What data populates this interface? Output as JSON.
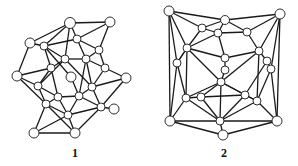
{
  "figure": {
    "structures": [
      {
        "label": "1",
        "label_pos": [
          75,
          146
        ],
        "nodes": [
          [
            70,
            23,
            5.5
          ],
          [
            110,
            22,
            5
          ],
          [
            30,
            43,
            5
          ],
          [
            44,
            46,
            4
          ],
          [
            77,
            39,
            4
          ],
          [
            99,
            50,
            4
          ],
          [
            65,
            59,
            4
          ],
          [
            86,
            59,
            4
          ],
          [
            51,
            68,
            4
          ],
          [
            105,
            68,
            4
          ],
          [
            17,
            76,
            5
          ],
          [
            71,
            77,
            5
          ],
          [
            126,
            78,
            5
          ],
          [
            38,
            86,
            4
          ],
          [
            92,
            87,
            4
          ],
          [
            58,
            97,
            4
          ],
          [
            79,
            96,
            4
          ],
          [
            46,
            104,
            4
          ],
          [
            101,
            107,
            4
          ],
          [
            114,
            109,
            5
          ],
          [
            68,
            115,
            4
          ],
          [
            34,
            133,
            5
          ],
          [
            75,
            133,
            5
          ]
        ],
        "edges": [
          [
            0,
            3
          ],
          [
            0,
            4
          ],
          [
            0,
            6
          ],
          [
            1,
            4
          ],
          [
            1,
            5
          ],
          [
            2,
            3
          ],
          [
            2,
            10
          ],
          [
            3,
            4
          ],
          [
            3,
            6
          ],
          [
            3,
            8
          ],
          [
            4,
            5
          ],
          [
            4,
            7
          ],
          [
            5,
            7
          ],
          [
            5,
            9
          ],
          [
            6,
            7
          ],
          [
            6,
            8
          ],
          [
            6,
            13
          ],
          [
            6,
            14
          ],
          [
            7,
            9
          ],
          [
            7,
            14
          ],
          [
            8,
            10
          ],
          [
            8,
            13
          ],
          [
            9,
            12
          ],
          [
            9,
            14
          ],
          [
            10,
            13
          ],
          [
            10,
            17
          ],
          [
            12,
            14
          ],
          [
            12,
            18
          ],
          [
            13,
            15
          ],
          [
            13,
            17
          ],
          [
            14,
            16
          ],
          [
            14,
            18
          ],
          [
            15,
            16
          ],
          [
            15,
            17
          ],
          [
            15,
            20
          ],
          [
            16,
            18
          ],
          [
            16,
            20
          ],
          [
            17,
            20
          ],
          [
            17,
            21
          ],
          [
            18,
            19
          ],
          [
            18,
            20
          ],
          [
            20,
            21
          ],
          [
            20,
            22
          ],
          [
            21,
            22
          ],
          [
            17,
            22
          ],
          [
            18,
            22
          ],
          [
            3,
            11
          ],
          [
            11,
            16
          ],
          [
            8,
            15
          ],
          [
            7,
            16
          ],
          [
            0,
            2
          ],
          [
            0,
            1
          ]
        ]
      },
      {
        "label": "2",
        "label_pos": [
          224,
          146
        ],
        "nodes": [
          [
            169,
            11,
            5
          ],
          [
            280,
            14,
            5
          ],
          [
            225,
            20,
            4.5
          ],
          [
            202,
            28,
            4
          ],
          [
            247,
            32,
            4
          ],
          [
            218,
            33,
            4
          ],
          [
            187,
            48,
            4
          ],
          [
            259,
            51,
            4
          ],
          [
            177,
            63,
            4
          ],
          [
            225,
            58,
            4
          ],
          [
            267,
            61,
            4
          ],
          [
            271,
            69,
            4
          ],
          [
            225,
            70,
            4
          ],
          [
            221,
            82,
            4
          ],
          [
            186,
            98,
            4
          ],
          [
            201,
            97,
            4
          ],
          [
            245,
            95,
            4
          ],
          [
            257,
            101,
            4
          ],
          [
            170,
            121,
            5
          ],
          [
            220,
            121,
            4
          ],
          [
            277,
            121,
            5
          ],
          [
            223,
            135,
            5
          ]
        ],
        "edges": [
          [
            0,
            2
          ],
          [
            0,
            3
          ],
          [
            0,
            6
          ],
          [
            0,
            8
          ],
          [
            1,
            2
          ],
          [
            1,
            4
          ],
          [
            1,
            7
          ],
          [
            1,
            11
          ],
          [
            2,
            3
          ],
          [
            2,
            4
          ],
          [
            2,
            5
          ],
          [
            3,
            5
          ],
          [
            3,
            6
          ],
          [
            4,
            5
          ],
          [
            4,
            7
          ],
          [
            5,
            9
          ],
          [
            5,
            6
          ],
          [
            6,
            8
          ],
          [
            6,
            9
          ],
          [
            6,
            13
          ],
          [
            7,
            10
          ],
          [
            7,
            9
          ],
          [
            7,
            13
          ],
          [
            8,
            14
          ],
          [
            8,
            18
          ],
          [
            9,
            12
          ],
          [
            10,
            11
          ],
          [
            10,
            16
          ],
          [
            11,
            17
          ],
          [
            11,
            20
          ],
          [
            12,
            13
          ],
          [
            13,
            14
          ],
          [
            13,
            15
          ],
          [
            13,
            16
          ],
          [
            13,
            17
          ],
          [
            13,
            19
          ],
          [
            14,
            15
          ],
          [
            14,
            18
          ],
          [
            15,
            19
          ],
          [
            15,
            16
          ],
          [
            16,
            17
          ],
          [
            16,
            19
          ],
          [
            17,
            20
          ],
          [
            18,
            19
          ],
          [
            18,
            21
          ],
          [
            19,
            21
          ],
          [
            20,
            21
          ],
          [
            19,
            20
          ],
          [
            14,
            19
          ],
          [
            17,
            19
          ],
          [
            6,
            14
          ],
          [
            7,
            17
          ],
          [
            0,
            18
          ],
          [
            1,
            20
          ],
          [
            8,
            6
          ]
        ]
      }
    ],
    "colors": {
      "stroke": "#1a1a1a",
      "node_fill": "#ffffff",
      "background": "#ffffff"
    }
  }
}
